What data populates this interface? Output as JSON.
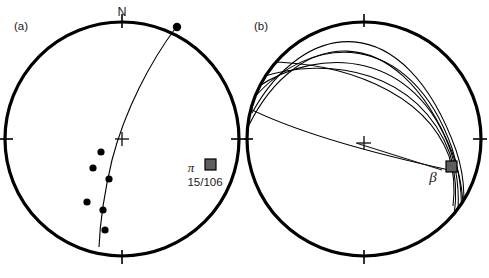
{
  "figure": {
    "type": "stereonet-pair",
    "background_color": "#ffffff",
    "line_color": "#000000",
    "marker_color": "#000000",
    "beta_marker_fill": "#5e5e5e",
    "beta_marker_stroke": "#000000",
    "label_color": "#3a3a3a"
  },
  "panel_a": {
    "tag": "(a)",
    "north_label": "N",
    "center_symbol": "+",
    "legend": {
      "symbol": "π",
      "marker": "gray-square",
      "count_text": "15/106"
    },
    "circle": {
      "cx": 122,
      "cy": 139,
      "r": 117,
      "stroke_width": 3.2
    },
    "ticks": [
      {
        "name": "north-tick",
        "angle_deg": 0
      },
      {
        "name": "east-tick",
        "angle_deg": 90
      },
      {
        "name": "south-tick",
        "angle_deg": 180
      },
      {
        "name": "west-tick",
        "angle_deg": 270
      }
    ],
    "pi_great_circle": {
      "description": "best-fit pi great circle",
      "path": "M 177 26 C 150 62, 125 110, 112 160 C 104 194, 100 222, 99 247"
    },
    "data_points": [
      {
        "x": 177,
        "y": 27,
        "r": 4.2,
        "on_primitive": true
      },
      {
        "x": 101,
        "y": 152,
        "r": 3.6,
        "on_primitive": false
      },
      {
        "x": 93,
        "y": 168,
        "r": 3.6,
        "on_primitive": false
      },
      {
        "x": 109,
        "y": 179,
        "r": 3.6,
        "on_primitive": false
      },
      {
        "x": 87,
        "y": 202,
        "r": 3.6,
        "on_primitive": false
      },
      {
        "x": 103,
        "y": 210,
        "r": 3.6,
        "on_primitive": false
      },
      {
        "x": 105,
        "y": 230,
        "r": 3.6,
        "on_primitive": false
      }
    ]
  },
  "panel_b": {
    "tag": "(b)",
    "center_symbol": "+",
    "beta_label": "β",
    "beta_marker": {
      "x": 208,
      "y": 167,
      "size": 11,
      "fill": "#5e5e5e"
    },
    "beta_leader": {
      "path": "M 112 143 L 198 170"
    },
    "circle": {
      "cx": 120,
      "cy": 139,
      "r": 117,
      "stroke_width": 3.2
    },
    "ticks": [
      {
        "name": "north-tick",
        "angle_deg": 0
      },
      {
        "name": "east-tick",
        "angle_deg": 90
      },
      {
        "name": "south-tick",
        "angle_deg": 180
      },
      {
        "name": "west-tick",
        "angle_deg": 270
      }
    ],
    "great_circles": [
      {
        "name": "great-circle-1",
        "path": "M 8 113 C 60 18, 160 6, 212 150 C 222 180, 222 212, 213 240"
      },
      {
        "name": "great-circle-2",
        "path": "M 5 125 C 52 30, 152 14, 208 152 C 220 184, 222 218, 215 248"
      },
      {
        "name": "great-circle-3",
        "path": "M 8 100 C 68 30, 166 30, 208 148 C 218 180, 220 210, 214 236"
      },
      {
        "name": "great-circle-4",
        "path": "M 12 88 C 78 44, 172 52, 207 152 C 215 178, 216 204, 212 228"
      },
      {
        "name": "great-circle-5",
        "path": "M 14 78 C 86 54, 176 72, 206 154 C 212 174, 213 196, 210 216"
      },
      {
        "name": "great-circle-6",
        "path": "M 22 62 C 96 62, 180 90, 205 156 C 210 172, 211 190, 209 206"
      },
      {
        "name": "great-circle-7",
        "path": "M 4 108 C 60 136, 150 158, 205 170"
      }
    ]
  }
}
